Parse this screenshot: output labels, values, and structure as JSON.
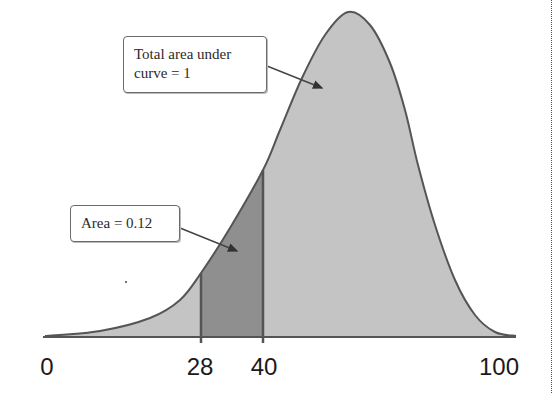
{
  "chart_data": {
    "type": "area",
    "title": "",
    "xlabel": "",
    "ylabel": "",
    "distribution": "left-skewed unimodal density curve",
    "x_ticks": [
      {
        "label": "0",
        "value": 0,
        "px": 47
      },
      {
        "label": "28",
        "value": 28,
        "px": 201
      },
      {
        "label": "40",
        "value": 40,
        "px": 263
      },
      {
        "label": "100",
        "value": 100,
        "px": 500
      }
    ],
    "xlim": [
      0,
      100
    ],
    "shaded_region": {
      "from": 28,
      "to": 40,
      "area": 0.12
    },
    "total_area": 1,
    "curve_px_points": [
      [
        45,
        336
      ],
      [
        100,
        331
      ],
      [
        150,
        318
      ],
      [
        180,
        300
      ],
      [
        201,
        273
      ],
      [
        230,
        228
      ],
      [
        263,
        170
      ],
      [
        280,
        130
      ],
      [
        302,
        78
      ],
      [
        325,
        35
      ],
      [
        348,
        12
      ],
      [
        370,
        25
      ],
      [
        390,
        63
      ],
      [
        405,
        110
      ],
      [
        418,
        165
      ],
      [
        435,
        225
      ],
      [
        455,
        280
      ],
      [
        475,
        315
      ],
      [
        495,
        332
      ],
      [
        516,
        336
      ]
    ],
    "baseline_px": 337,
    "grid": false,
    "legend": null,
    "annotations": [
      {
        "text": "Total area under curve = 1",
        "points_to": "main curve region"
      },
      {
        "text": "Area = 0.12",
        "points_to": "shaded region between 28 and 40"
      }
    ]
  },
  "callouts": {
    "total": {
      "line1": "Total area under",
      "line2": "curve = 1"
    },
    "area": {
      "text": "Area = 0.12"
    }
  },
  "colors": {
    "curve_fill": "#c4c4c4",
    "shaded_fill": "#8f8f8f",
    "left_tail_fill": "#cfcfcf",
    "line": "#555555"
  },
  "ticks": {
    "t0": "0",
    "t28": "28",
    "t40": "40",
    "t100": "100"
  }
}
